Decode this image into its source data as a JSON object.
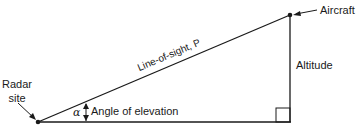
{
  "diagram": {
    "labels": {
      "radar_site_line1": "Radar",
      "radar_site_line2": "site",
      "aircraft": "Aircraft",
      "line_of_sight": "Line-of-sight, P",
      "altitude": "Altitude",
      "angle_symbol": "α",
      "angle_label": "Angle of elevation"
    },
    "colors": {
      "line": "#1a1a1a",
      "background": "#ffffff"
    }
  }
}
